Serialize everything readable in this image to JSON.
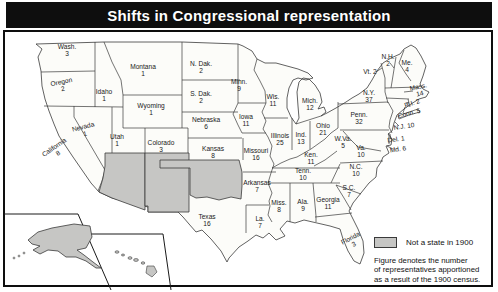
{
  "title": "Shifts in Congressional representation",
  "legend": {
    "swatch_color": "#c6c6c4",
    "label": "Not a state in 1900"
  },
  "caption": [
    "Figure denotes the number",
    "of representatives apportioned",
    "as a result of the 1900 census."
  ],
  "map": {
    "description": "United States map showing representatives apportioned after the 1900 census",
    "territories_not_states_1900": [
      "Arizona",
      "New Mexico",
      "Oklahoma",
      "Alaska",
      "Hawaii"
    ],
    "colors": {
      "not_a_state_fill": "#c6c6c4",
      "state_fill": "#fcfcf9",
      "border_line": "#3a3a3a"
    },
    "states": [
      {
        "id": "washington",
        "name": "Wash.",
        "seats": "3",
        "x": 67,
        "y": 50
      },
      {
        "id": "oregon",
        "name": "Oregon",
        "seats": "2",
        "x": 62,
        "y": 85,
        "rotate": -12
      },
      {
        "id": "california",
        "name": "California",
        "seats": "8",
        "x": 56,
        "y": 150,
        "rotate": -35
      },
      {
        "id": "idaho",
        "name": "Idaho",
        "seats": "1",
        "x": 104,
        "y": 95
      },
      {
        "id": "nevada",
        "name": "Nevada",
        "seats": "1",
        "x": 84,
        "y": 130,
        "rotate": -15
      },
      {
        "id": "utah",
        "name": "Utah",
        "seats": "1",
        "x": 117,
        "y": 140
      },
      {
        "id": "montana",
        "name": "Montana",
        "seats": "1",
        "x": 143,
        "y": 70
      },
      {
        "id": "wyoming",
        "name": "Wyoming",
        "seats": "1",
        "x": 151,
        "y": 109
      },
      {
        "id": "colorado",
        "name": "Colorado",
        "seats": "3",
        "x": 161,
        "y": 146
      },
      {
        "id": "north-dakota",
        "name": "N. Dak.",
        "seats": "2",
        "x": 201,
        "y": 67
      },
      {
        "id": "south-dakota",
        "name": "S. Dak.",
        "seats": "2",
        "x": 201,
        "y": 97
      },
      {
        "id": "nebraska",
        "name": "Nebraska",
        "seats": "6",
        "x": 206,
        "y": 123
      },
      {
        "id": "kansas",
        "name": "Kansas",
        "seats": "8",
        "x": 213,
        "y": 152
      },
      {
        "id": "minnesota",
        "name": "Minn.",
        "seats": "9",
        "x": 239,
        "y": 85
      },
      {
        "id": "iowa",
        "name": "Iowa",
        "seats": "11",
        "x": 246,
        "y": 120
      },
      {
        "id": "missouri",
        "name": "Missouri",
        "seats": "16",
        "x": 256,
        "y": 154
      },
      {
        "id": "arkansas",
        "name": "Arkansas",
        "seats": "7",
        "x": 257,
        "y": 186
      },
      {
        "id": "louisiana",
        "name": "La.",
        "seats": "7",
        "x": 260,
        "y": 222
      },
      {
        "id": "texas",
        "name": "Texas",
        "seats": "16",
        "x": 207,
        "y": 220
      },
      {
        "id": "wisconsin",
        "name": "Wis.",
        "seats": "11",
        "x": 273,
        "y": 100
      },
      {
        "id": "illinois",
        "name": "Illinois",
        "seats": "25",
        "x": 280,
        "y": 139
      },
      {
        "id": "indiana",
        "name": "Ind.",
        "seats": "13",
        "x": 301,
        "y": 138
      },
      {
        "id": "ohio",
        "name": "Ohio",
        "seats": "21",
        "x": 323,
        "y": 129
      },
      {
        "id": "michigan",
        "name": "Mich.",
        "seats": "12",
        "x": 310,
        "y": 104
      },
      {
        "id": "kentucky",
        "name": "Ken.",
        "seats": "11",
        "x": 311,
        "y": 158
      },
      {
        "id": "tennessee",
        "name": "Tenn.",
        "seats": "10",
        "x": 303,
        "y": 174
      },
      {
        "id": "mississippi",
        "name": "Miss.",
        "seats": "8",
        "x": 279,
        "y": 206
      },
      {
        "id": "alabama",
        "name": "Ala.",
        "seats": "9",
        "x": 303,
        "y": 205
      },
      {
        "id": "georgia",
        "name": "Georgia",
        "seats": "11",
        "x": 328,
        "y": 203
      },
      {
        "id": "florida",
        "name": "Florida",
        "seats": "3",
        "x": 352,
        "y": 241,
        "rotate": -28
      },
      {
        "id": "south-carolina",
        "name": "S.C.",
        "seats": "7",
        "x": 349,
        "y": 191
      },
      {
        "id": "north-carolina",
        "name": "N.C.",
        "seats": "10",
        "x": 356,
        "y": 170
      },
      {
        "id": "virginia",
        "name": "Va.",
        "seats": "10",
        "x": 361,
        "y": 151
      },
      {
        "id": "west-virginia",
        "name": "W.Va.",
        "seats": "5",
        "x": 343,
        "y": 142
      },
      {
        "id": "pennsylvania",
        "name": "Penn.",
        "seats": "32",
        "x": 359,
        "y": 118
      },
      {
        "id": "new-york",
        "name": "N.Y.",
        "seats": "37",
        "x": 369,
        "y": 96
      },
      {
        "id": "vermont",
        "name": "Vt.",
        "seats": "2",
        "x": 370,
        "y": 72,
        "inline": true
      },
      {
        "id": "new-hampshire",
        "name": "N.H.",
        "seats": "2",
        "x": 388,
        "y": 60
      },
      {
        "id": "maine",
        "name": "Me.",
        "seats": "4",
        "x": 407,
        "y": 66
      },
      {
        "id": "massachusetts",
        "name": "Mass.",
        "seats": "14",
        "x": 419,
        "y": 90,
        "rotate": -12
      },
      {
        "id": "rhode-island",
        "name": "R.I.",
        "seats": "2",
        "x": 412,
        "y": 103,
        "inline": true,
        "rotate": -18
      },
      {
        "id": "connecticut",
        "name": "Conn.",
        "seats": "5",
        "x": 409,
        "y": 113,
        "inline": true,
        "rotate": -14
      },
      {
        "id": "new-jersey",
        "name": "N.J.",
        "seats": "10",
        "x": 404,
        "y": 126,
        "inline": true,
        "rotate": -8
      },
      {
        "id": "delaware",
        "name": "Del.",
        "seats": "1",
        "x": 396,
        "y": 139,
        "inline": true,
        "rotate": -8
      },
      {
        "id": "maryland",
        "name": "Md.",
        "seats": "6",
        "x": 398,
        "y": 149,
        "inline": true,
        "rotate": -8
      }
    ]
  }
}
